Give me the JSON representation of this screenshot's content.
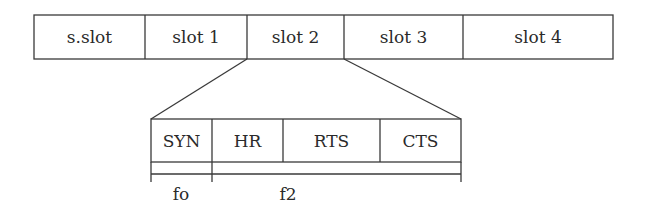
{
  "diagram": {
    "type": "frame-structure",
    "top_frame": {
      "slots": [
        {
          "label": "s.slot",
          "x0": 34,
          "x1": 145
        },
        {
          "label": "slot 1",
          "x0": 145,
          "x1": 247
        },
        {
          "label": "slot 2",
          "x0": 247,
          "x1": 344
        },
        {
          "label": "slot 3",
          "x0": 344,
          "x1": 463
        },
        {
          "label": "slot 4",
          "x0": 463,
          "x1": 613
        }
      ],
      "expanded_slot_index": 2
    },
    "expanded_slot": {
      "fields": [
        {
          "label": "SYN",
          "x0": 151,
          "x1": 212
        },
        {
          "label": "HR",
          "x0": 212,
          "x1": 283
        },
        {
          "label": "RTS",
          "x0": 283,
          "x1": 380
        },
        {
          "label": "CTS",
          "x0": 380,
          "x1": 461
        }
      ]
    },
    "brackets": [
      {
        "label": "fo",
        "x0": 151,
        "x1": 212
      },
      {
        "label": "f2",
        "x0": 212,
        "x1": 461
      }
    ],
    "colors": {
      "line": "#3a3a3a",
      "text": "#2a2a2a",
      "background": "#ffffff"
    }
  }
}
